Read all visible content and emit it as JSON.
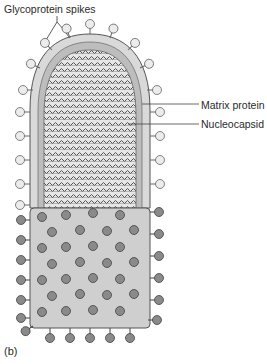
{
  "figure": {
    "panel_label": "(b)",
    "labels": {
      "glycoprotein_spikes": "Glycoprotein spikes",
      "matrix_protein": "Matrix protein",
      "nucleocapsid": "Nucleocapsid"
    },
    "colors": {
      "envelope": "#d9d9d9",
      "matrix": "#bdbdbd",
      "spike_light": "#e8e8e8",
      "spike_dark": "#8a8a8a",
      "surface": "#cfcfcf",
      "outline": "#555555",
      "nucleocapsid_stripe": "#444444"
    }
  }
}
